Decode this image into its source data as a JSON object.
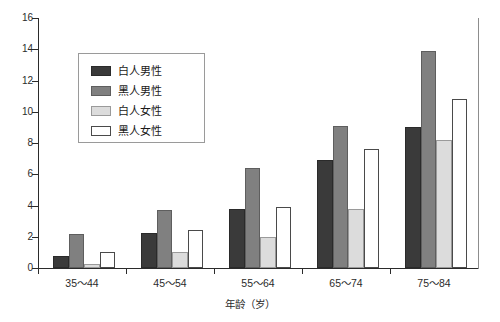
{
  "chart_data": {
    "type": "bar",
    "title": "",
    "xlabel": "年龄（岁）",
    "ylabel": "",
    "categories": [
      "35～44",
      "45～54",
      "55～64",
      "65～74",
      "75～84"
    ],
    "series": [
      {
        "name": "白人男性",
        "color": "#3a3a3a",
        "values": [
          0.8,
          2.25,
          3.8,
          6.9,
          9.0
        ]
      },
      {
        "name": "黑人男性",
        "color": "#808080",
        "values": [
          2.2,
          3.7,
          6.4,
          9.1,
          13.9
        ]
      },
      {
        "name": "白人女性",
        "color": "#dcdcdc",
        "values": [
          0.25,
          1.05,
          2.0,
          3.8,
          8.2
        ]
      },
      {
        "name": "黑人女性",
        "color": "#ffffff",
        "values": [
          1.0,
          2.45,
          3.9,
          7.6,
          10.8
        ]
      }
    ],
    "ylim": [
      0,
      16
    ],
    "yticks": [
      0,
      2,
      4,
      6,
      8,
      10,
      12,
      14,
      16
    ],
    "grid": false,
    "legend_position": "upper-left-inset"
  }
}
